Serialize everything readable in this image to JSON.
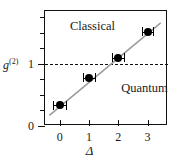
{
  "figure": {
    "background_color": "#ffffff",
    "axis_color": "#111111",
    "marker_color": "#000000",
    "fit_line_color": "#9a9a9a"
  },
  "chart_data": {
    "type": "scatter",
    "title": "",
    "xlabel": "Δ",
    "ylabel": "g",
    "ylabel_superscript": "(2)",
    "x": [
      0,
      1,
      2,
      3
    ],
    "values": [
      0.33,
      0.78,
      1.1,
      1.52
    ],
    "xerr": [
      0.22,
      0.2,
      0.2,
      0.2
    ],
    "series": [
      {
        "name": "measured g2",
        "x": [
          0,
          1,
          2,
          3
        ],
        "values": [
          0.33,
          0.78,
          1.1,
          1.52
        ]
      },
      {
        "name": "linear fit",
        "x": [
          -0.35,
          3.45
        ],
        "values": [
          0.17,
          1.66
        ]
      }
    ],
    "xlim": [
      -0.5,
      3.7
    ],
    "ylim": [
      0,
      1.85
    ],
    "xticks": [
      0,
      1,
      2,
      3
    ],
    "xtick_labels": [
      "0",
      "1",
      "2",
      "3"
    ],
    "yticks": [
      0,
      0.25,
      0.5,
      0.75,
      1.0,
      1.25,
      1.5,
      1.75
    ],
    "ytick_labels": [
      "0",
      "",
      "",
      "",
      "1",
      "",
      "",
      ""
    ],
    "grid": false,
    "legend": "none",
    "threshold_line": {
      "y": 1.0,
      "style": "dashed",
      "label": ""
    },
    "annotations": [
      {
        "text": "Classical",
        "x": 0.35,
        "y": 1.6
      },
      {
        "text": "Quantum",
        "x": 2.1,
        "y": 0.6
      }
    ]
  }
}
